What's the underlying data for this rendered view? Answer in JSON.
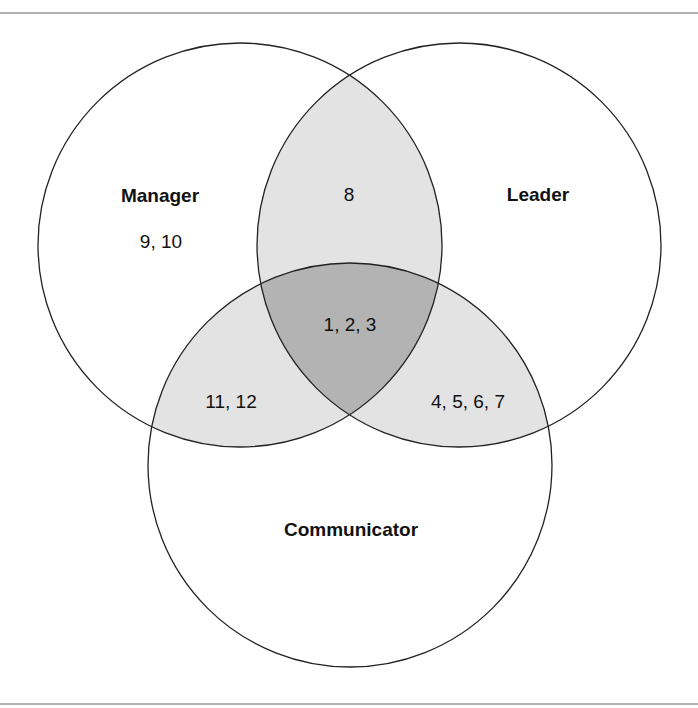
{
  "diagram": {
    "type": "venn",
    "sets": [
      {
        "name": "Manager",
        "label": "Manager",
        "cx": 240,
        "cy": 245,
        "r": 202
      },
      {
        "name": "Leader",
        "label": "Leader",
        "cx": 459,
        "cy": 245,
        "r": 202
      },
      {
        "name": "Communicator",
        "label": "Communicator",
        "cx": 350,
        "cy": 465,
        "r": 202
      }
    ],
    "regions": {
      "manager_only": "9, 10",
      "manager_leader": "8",
      "all_three": "1, 2, 3",
      "manager_communicator": "11, 12",
      "leader_communicator": "4, 5, 6, 7"
    },
    "colors": {
      "outline": "#222222",
      "pair_overlap": "#e3e3e3",
      "triple_overlap": "#b3b3b3",
      "rule": "#9a9a9a",
      "background": "#ffffff"
    }
  }
}
